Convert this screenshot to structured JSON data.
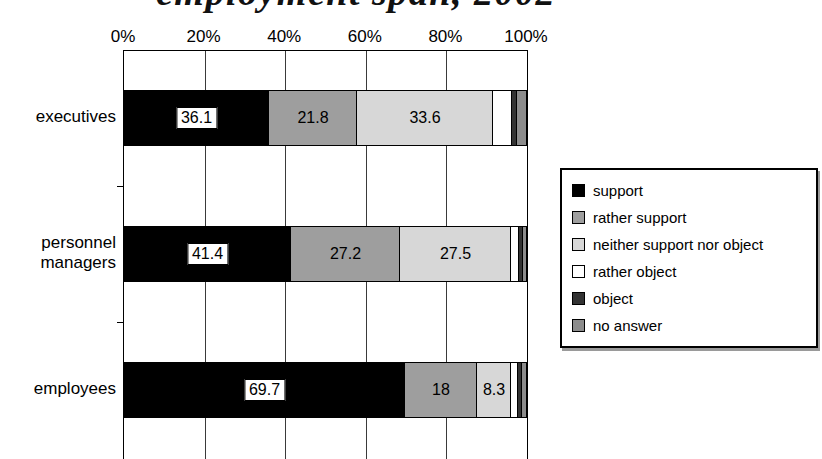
{
  "title_fragment": "employment span, 2002",
  "chart_data": {
    "type": "bar",
    "variant": "stacked-horizontal",
    "categories": [
      "executives",
      "personnel managers",
      "employees"
    ],
    "series": [
      {
        "name": "support",
        "color": "#000000",
        "values": [
          36.1,
          41.4,
          69.7
        ],
        "labels": [
          "36.1",
          "41.4",
          "69.7"
        ]
      },
      {
        "name": "rather support",
        "color": "#9e9e9e",
        "values": [
          21.8,
          27.2,
          18
        ],
        "labels": [
          "21.8",
          "27.2",
          "18"
        ]
      },
      {
        "name": "neither support nor object",
        "color": "#d7d7d7",
        "values": [
          33.6,
          27.5,
          8.3
        ],
        "labels": [
          "33.6",
          "27.5",
          "8.3"
        ]
      },
      {
        "name": "rather object",
        "color": "#ffffff",
        "values": [
          4.9,
          1.9,
          1.7
        ],
        "labels": [
          null,
          null,
          null
        ]
      },
      {
        "name": "object",
        "color": "#333333",
        "values": [
          1.0,
          1.0,
          1.0
        ],
        "labels": [
          null,
          null,
          null
        ]
      },
      {
        "name": "no answer",
        "color": "#8c8c8c",
        "values": [
          2.6,
          1.0,
          1.3
        ],
        "labels": [
          null,
          null,
          null
        ]
      }
    ],
    "x_ticks": [
      {
        "pct": 0,
        "label": "0%"
      },
      {
        "pct": 20,
        "label": "20%"
      },
      {
        "pct": 40,
        "label": "40%"
      },
      {
        "pct": 60,
        "label": "60%"
      },
      {
        "pct": 80,
        "label": "80%"
      },
      {
        "pct": 100,
        "label": "100%"
      }
    ],
    "xlim": [
      0,
      100
    ],
    "grid": "vertical-only",
    "legend_position": "right",
    "value_label_box_on_black": true
  }
}
